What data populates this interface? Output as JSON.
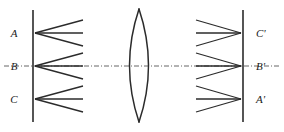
{
  "figure": {
    "type": "optical-ray-diagram",
    "background_color": "#ffffff",
    "stroke_color": "#2b2b2b",
    "axis_color": "#555555"
  },
  "object_plane": {
    "name": "object-plane",
    "x": 33,
    "y_top": 10,
    "y_bottom": 122,
    "points": [
      {
        "label": "A",
        "y": 33,
        "label_x": 14,
        "label_y": 37
      },
      {
        "label": "B",
        "y": 66,
        "label_x": 14,
        "label_y": 70
      },
      {
        "label": "C",
        "y": 99,
        "label_x": 14,
        "label_y": 103
      }
    ]
  },
  "image_plane": {
    "name": "image-plane",
    "x": 243,
    "y_top": 10,
    "y_bottom": 122,
    "points": [
      {
        "label": "C'",
        "y": 33,
        "label_x": 256,
        "label_y": 37
      },
      {
        "label": "B'",
        "y": 66,
        "label_x": 256,
        "label_y": 70
      },
      {
        "label": "A'",
        "y": 99,
        "label_x": 256,
        "label_y": 103
      }
    ]
  },
  "lens": {
    "name": "biconvex-lens",
    "center_x": 139,
    "top_y": 9,
    "bottom_y": 122,
    "bulge": 19
  },
  "optical_axis": {
    "name": "optical-axis",
    "y": 66,
    "x_start": 4,
    "x_end": 280,
    "style": "dash-dot"
  },
  "ray_bundles": {
    "object_side": {
      "x_start_offset": 2,
      "x_end": 83,
      "rays_per_point": 3,
      "spread_half_height": 13
    },
    "image_side": {
      "x_start": 196,
      "x_end_offset": -2,
      "rays_per_point": 3,
      "spread_half_height": 13
    }
  },
  "chart_data": {
    "type": "diagram",
    "title": ""
  }
}
